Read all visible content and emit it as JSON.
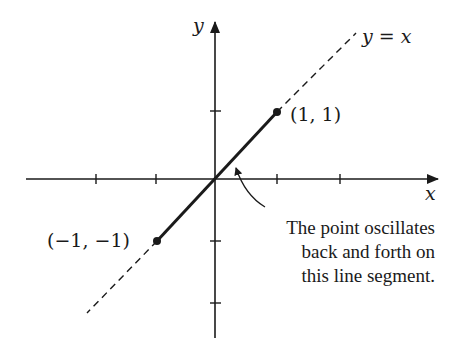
{
  "diagram": {
    "axes": {
      "x_label": "x",
      "y_label": "y",
      "origin_px": [
        215,
        179
      ],
      "unit_px": 61,
      "x_ticks": [
        -2,
        -1,
        1,
        2
      ],
      "y_ticks": [
        1,
        -1,
        -2
      ]
    },
    "line": {
      "label": "y = x",
      "style": "dashed"
    },
    "segment": {
      "from": [
        -1,
        -1
      ],
      "to": [
        1,
        1
      ],
      "style": "solid-thick"
    },
    "points": [
      {
        "label": "(1, 1)",
        "x": 1,
        "y": 1
      },
      {
        "label": "(−1, −1)",
        "x": -1,
        "y": -1
      }
    ],
    "annotation": {
      "lines": [
        "The point oscillates",
        "back and forth on",
        "this line segment."
      ]
    },
    "colors": {
      "ink": "#1a1a1a",
      "background": "#ffffff"
    }
  }
}
